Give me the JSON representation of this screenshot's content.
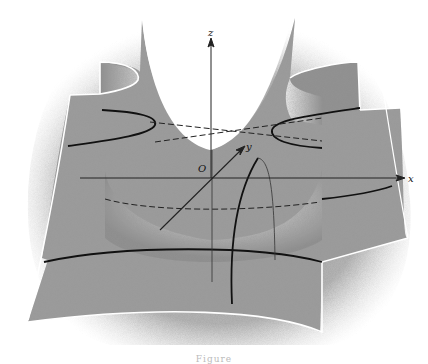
{
  "figure": {
    "type": "3d-surface-illustration",
    "axes": {
      "x_label": "x",
      "y_label": "y",
      "z_label": "z",
      "origin_label": "O"
    },
    "caption": "Figure"
  },
  "colors": {
    "background": "#ffffff",
    "surface_dark": "#7a7a7a",
    "surface_mid": "#a8a8a8",
    "surface_light": "#e6e6e6",
    "curve": "#111111",
    "axis": "#222222"
  }
}
